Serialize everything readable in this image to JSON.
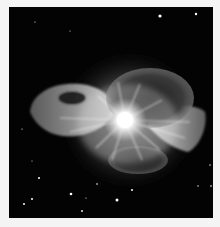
{
  "image": {
    "subject": "nebula explosion with bright central star",
    "colors": {
      "background": "#030303",
      "border": "#f4f4f4",
      "core": "#ffffff",
      "glow": "#bdbdbd",
      "filaments": "#9a9a9a",
      "dark_lobe": "#2a2a2a"
    },
    "stars": [
      {
        "x": 160,
        "y": 16,
        "r": 1.6
      },
      {
        "x": 196,
        "y": 14,
        "r": 1.2
      },
      {
        "x": 35,
        "y": 22,
        "r": 0.6
      },
      {
        "x": 70,
        "y": 31,
        "r": 0.5
      },
      {
        "x": 22,
        "y": 129,
        "r": 0.6
      },
      {
        "x": 32,
        "y": 161,
        "r": 0.5
      },
      {
        "x": 39,
        "y": 178,
        "r": 1.0
      },
      {
        "x": 71,
        "y": 194,
        "r": 1.3
      },
      {
        "x": 32,
        "y": 199,
        "r": 1.0
      },
      {
        "x": 24,
        "y": 204,
        "r": 1.0
      },
      {
        "x": 97,
        "y": 184,
        "r": 0.8
      },
      {
        "x": 132,
        "y": 190,
        "r": 1.0
      },
      {
        "x": 117,
        "y": 200,
        "r": 1.5
      },
      {
        "x": 82,
        "y": 211,
        "r": 0.9
      },
      {
        "x": 86,
        "y": 198,
        "r": 0.6
      },
      {
        "x": 198,
        "y": 186,
        "r": 0.7
      },
      {
        "x": 211,
        "y": 186,
        "r": 0.8
      },
      {
        "x": 210,
        "y": 165,
        "r": 0.7
      }
    ]
  }
}
